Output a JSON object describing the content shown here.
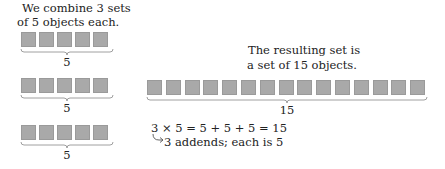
{
  "intro_text": [
    "We combine 3 sets",
    "of 5 objects each."
  ],
  "groups": [
    {
      "count": 5,
      "label": "5"
    },
    {
      "count": 5,
      "label": "5"
    },
    {
      "count": 5,
      "label": "5"
    }
  ],
  "result_text": [
    "The resulting set is",
    "a set of 15 objects."
  ],
  "result_set": {
    "count": 15,
    "label": "15"
  },
  "equation": "3 × 5 = 5 + 5 + 5 = 15",
  "annotation": "3 addends; each is 5",
  "colors": {
    "square_fill": "#a9a9a9",
    "text": "#222222",
    "brace": "#888888"
  }
}
